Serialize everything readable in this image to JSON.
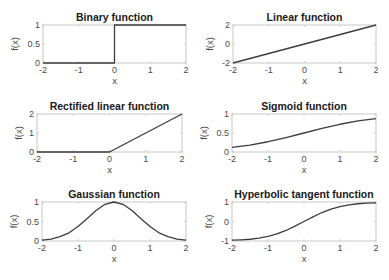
{
  "figure": {
    "width": 389,
    "height": 280,
    "line_color": "#3c3c3c",
    "axis_color": "#c8c8c8"
  },
  "chart_data": [
    {
      "type": "line",
      "title": "Binary function",
      "xlabel": "x",
      "ylabel": "f(x)",
      "xlim": [
        -2,
        2
      ],
      "ylim": [
        0,
        1
      ],
      "xticks": [
        -2,
        -1,
        0,
        1,
        2
      ],
      "xtick_labels": [
        "-2",
        "-1",
        "0",
        "1",
        "2"
      ],
      "yticks": [
        0,
        0.5,
        1
      ],
      "ytick_labels": [
        "0",
        "0.5",
        "1"
      ],
      "grid": false,
      "x": [
        -2,
        0,
        0,
        2
      ],
      "y": [
        0,
        0,
        1,
        1
      ],
      "box": {
        "left": 43,
        "top": 25,
        "right": 186,
        "bottom": 63
      }
    },
    {
      "type": "line",
      "title": "Linear function",
      "xlabel": "x",
      "ylabel": "f(x)",
      "xlim": [
        -2,
        2
      ],
      "ylim": [
        -2,
        2
      ],
      "xticks": [
        -2,
        -1,
        0,
        1,
        2
      ],
      "xtick_labels": [
        "-2",
        "-1",
        "0",
        "1",
        "2"
      ],
      "yticks": [
        -2,
        0,
        2
      ],
      "ytick_labels": [
        "-2",
        "0",
        "2"
      ],
      "grid": false,
      "x": [
        -2,
        -1,
        0,
        1,
        2
      ],
      "y": [
        -2,
        -1,
        0,
        1,
        2
      ],
      "box": {
        "left": 233,
        "top": 25,
        "right": 376,
        "bottom": 63
      }
    },
    {
      "type": "line",
      "title": "Rectified linear function",
      "xlabel": "x",
      "ylabel": "f(x)",
      "xlim": [
        -2,
        2
      ],
      "ylim": [
        0,
        2
      ],
      "xticks": [
        -2,
        -1,
        0,
        1,
        2
      ],
      "xtick_labels": [
        "-2",
        "-1",
        "0",
        "1",
        "2"
      ],
      "yticks": [
        0,
        1,
        2
      ],
      "ytick_labels": [
        "0",
        "1",
        "2"
      ],
      "grid": false,
      "x": [
        -2,
        -1,
        0,
        1,
        2
      ],
      "y": [
        0,
        0,
        0,
        1,
        2
      ],
      "box": {
        "left": 37,
        "top": 114,
        "right": 182,
        "bottom": 152
      }
    },
    {
      "type": "line",
      "title": "Sigmoid function",
      "xlabel": "x",
      "ylabel": "f(x)",
      "xlim": [
        -2,
        2
      ],
      "ylim": [
        0,
        1
      ],
      "xticks": [
        -2,
        -1,
        0,
        1,
        2
      ],
      "xtick_labels": [
        "-2",
        "-1",
        "0",
        "1",
        "2"
      ],
      "yticks": [
        0,
        0.5,
        1
      ],
      "ytick_labels": [
        "0",
        "0.5",
        "1"
      ],
      "grid": false,
      "x": [
        -2,
        -1.5,
        -1,
        -0.5,
        0,
        0.5,
        1,
        1.5,
        2
      ],
      "y": [
        0.12,
        0.18,
        0.27,
        0.38,
        0.5,
        0.62,
        0.73,
        0.82,
        0.88
      ],
      "box": {
        "left": 232,
        "top": 114,
        "right": 376,
        "bottom": 152
      }
    },
    {
      "type": "line",
      "title": "Gaussian function",
      "xlabel": "x",
      "ylabel": "f(x)",
      "xlim": [
        -2,
        2
      ],
      "ylim": [
        0,
        1
      ],
      "xticks": [
        -2,
        -1,
        0,
        1,
        2
      ],
      "xtick_labels": [
        "-2",
        "-1",
        "0",
        "1",
        "2"
      ],
      "yticks": [
        0,
        0.5,
        1
      ],
      "ytick_labels": [
        "0",
        "0.5",
        "1"
      ],
      "grid": false,
      "x": [
        -2,
        -1.75,
        -1.5,
        -1.25,
        -1,
        -0.75,
        -0.5,
        -0.25,
        0,
        0.25,
        0.5,
        0.75,
        1,
        1.25,
        1.5,
        1.75,
        2
      ],
      "y": [
        0.02,
        0.05,
        0.11,
        0.21,
        0.37,
        0.57,
        0.78,
        0.94,
        1.0,
        0.94,
        0.78,
        0.57,
        0.37,
        0.21,
        0.11,
        0.05,
        0.02
      ],
      "box": {
        "left": 42,
        "top": 202,
        "right": 186,
        "bottom": 241
      }
    },
    {
      "type": "line",
      "title": "Hyperbolic tangent  function",
      "xlabel": "x",
      "ylabel": "f(x)",
      "xlim": [
        -2,
        2
      ],
      "ylim": [
        -1,
        1
      ],
      "xticks": [
        -2,
        -1,
        0,
        1,
        2
      ],
      "xtick_labels": [
        "-2",
        "-1",
        "0",
        "1",
        "2"
      ],
      "yticks": [
        -1,
        0,
        1
      ],
      "ytick_labels": [
        "-1",
        "0",
        "1"
      ],
      "grid": false,
      "x": [
        -2,
        -1.75,
        -1.5,
        -1.25,
        -1,
        -0.75,
        -0.5,
        -0.25,
        0,
        0.25,
        0.5,
        0.75,
        1,
        1.25,
        1.5,
        1.75,
        2
      ],
      "y": [
        -0.96,
        -0.94,
        -0.91,
        -0.85,
        -0.76,
        -0.64,
        -0.46,
        -0.24,
        0,
        0.24,
        0.46,
        0.64,
        0.76,
        0.85,
        0.91,
        0.94,
        0.96
      ],
      "box": {
        "left": 232,
        "top": 202,
        "right": 376,
        "bottom": 241
      }
    }
  ]
}
